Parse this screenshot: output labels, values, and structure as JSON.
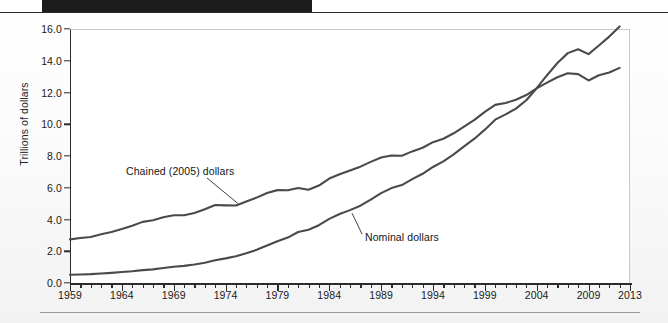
{
  "figure": {
    "y_axis_title": "Trillions of dollars",
    "y_ticks": [
      "0.0",
      "2.0",
      "4.0",
      "6.0",
      "8.0",
      "10.0",
      "12.0",
      "14.0",
      "16.0"
    ],
    "x_ticks": [
      "1959",
      "1964",
      "1969",
      "1974",
      "1979",
      "1984",
      "1989",
      "1994",
      "1999",
      "2004",
      "2009",
      "2013"
    ],
    "annotation_chained": "Chained (2005) dollars",
    "annotation_nominal": "Nominal dollars",
    "line_color": "#4a4a4a",
    "axis_color": "#2b2b2b",
    "plot_bg": "#ffffff"
  },
  "chart_data": {
    "type": "line",
    "title": "",
    "xlabel": "",
    "ylabel": "Trillions of dollars",
    "xlim": [
      1959,
      2013
    ],
    "ylim": [
      0.0,
      16.0
    ],
    "ytick_step": 2.0,
    "xtick_labeled_step": 5,
    "xtick_minor_step": 1,
    "grid": false,
    "legend": "inline-annotations",
    "x": [
      1959,
      1960,
      1961,
      1962,
      1963,
      1964,
      1965,
      1966,
      1967,
      1968,
      1969,
      1970,
      1971,
      1972,
      1973,
      1974,
      1975,
      1976,
      1977,
      1978,
      1979,
      1980,
      1981,
      1982,
      1983,
      1984,
      1985,
      1986,
      1987,
      1988,
      1989,
      1990,
      1991,
      1992,
      1993,
      1994,
      1995,
      1996,
      1997,
      1998,
      1999,
      2000,
      2001,
      2002,
      2003,
      2004,
      2005,
      2006,
      2007,
      2008,
      2009,
      2010,
      2011,
      2012
    ],
    "series": [
      {
        "name": "Chained (2005) dollars",
        "annotation": "Chained (2005) dollars",
        "color": "#4a4a4a",
        "values": [
          2.75,
          2.83,
          2.9,
          3.07,
          3.21,
          3.4,
          3.61,
          3.85,
          3.95,
          4.14,
          4.27,
          4.27,
          4.41,
          4.64,
          4.91,
          4.89,
          4.88,
          5.14,
          5.38,
          5.67,
          5.85,
          5.84,
          5.99,
          5.87,
          6.14,
          6.58,
          6.85,
          7.09,
          7.33,
          7.63,
          7.9,
          8.03,
          8.02,
          8.29,
          8.52,
          8.87,
          9.09,
          9.43,
          9.85,
          10.28,
          10.78,
          11.22,
          11.34,
          11.54,
          11.84,
          12.26,
          12.62,
          12.96,
          13.21,
          13.16,
          12.76,
          13.09,
          13.26,
          13.55
        ]
      },
      {
        "name": "Nominal dollars",
        "annotation": "Nominal dollars",
        "color": "#4a4a4a",
        "values": [
          0.52,
          0.54,
          0.56,
          0.6,
          0.64,
          0.69,
          0.74,
          0.81,
          0.86,
          0.94,
          1.02,
          1.08,
          1.17,
          1.28,
          1.43,
          1.55,
          1.69,
          1.88,
          2.09,
          2.36,
          2.63,
          2.86,
          3.21,
          3.35,
          3.64,
          4.04,
          4.35,
          4.59,
          4.87,
          5.25,
          5.66,
          5.98,
          6.17,
          6.54,
          6.88,
          7.31,
          7.66,
          8.1,
          8.61,
          9.09,
          9.66,
          10.29,
          10.62,
          10.98,
          11.51,
          12.27,
          13.09,
          13.86,
          14.48,
          14.72,
          14.42,
          14.96,
          15.52,
          16.16
        ]
      }
    ]
  }
}
